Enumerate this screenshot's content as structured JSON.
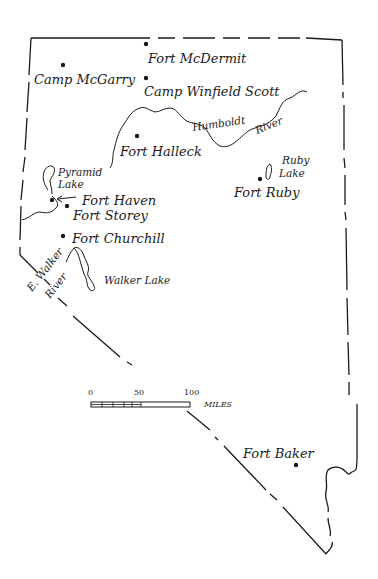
{
  "map": {
    "region": "Nevada",
    "forts": [
      {
        "name": "Fort McDermit",
        "x": 146,
        "y": 44
      },
      {
        "name": "Camp McGarry",
        "x": 63,
        "y": 65
      },
      {
        "name": "Camp Winfield Scott",
        "x": 146,
        "y": 78
      },
      {
        "name": "Fort Halleck",
        "x": 137,
        "y": 136
      },
      {
        "name": "Fort Ruby",
        "x": 260,
        "y": 179
      },
      {
        "name": "Fort Haven",
        "x": 52,
        "y": 200
      },
      {
        "name": "Fort Storey",
        "x": 67,
        "y": 206
      },
      {
        "name": "Fort Churchill",
        "x": 63,
        "y": 236
      },
      {
        "name": "Fort Baker",
        "x": 296,
        "y": 465
      }
    ],
    "labels": {
      "fort_mcdermit": "Fort McDermit",
      "camp_mcgarry": "Camp McGarry",
      "camp_winfield_scott": "Camp Winfield Scott",
      "fort_halleck": "Fort Halleck",
      "fort_ruby": "Fort Ruby",
      "fort_haven": "Fort Haven",
      "fort_storey": "Fort Storey",
      "fort_churchill": "Fort Churchill",
      "fort_baker": "Fort Baker",
      "humboldt": "Humboldt",
      "river1": "River",
      "ruby": "Ruby",
      "lake1": "Lake",
      "pyramid": "Pyramid",
      "lake2": "Lake",
      "e_walker": "E. Walker",
      "river2": "River",
      "walker_lake": "Walker Lake"
    },
    "scale": {
      "tick0": "0",
      "tick50": "50",
      "tick100": "100",
      "unit": "MILES"
    }
  }
}
